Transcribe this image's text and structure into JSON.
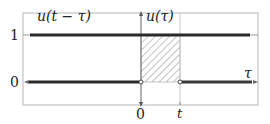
{
  "diagram": {
    "labels": {
      "shifted_step": "u(t − τ)",
      "step": "u(τ)",
      "y_one": "1",
      "y_zero": "0",
      "x_zero": "0",
      "x_t": "t",
      "x_axis": "τ"
    },
    "colors": {
      "frame": "#b0b0b0",
      "line": "#2a2a2a",
      "hatch": "#888888",
      "axis": "#555555",
      "background": "#ffffff"
    },
    "geometry": {
      "frame": {
        "x": 23,
        "y": 13,
        "w": 235,
        "h": 92
      },
      "axis_x": 141,
      "t_x": 180,
      "level_one_y": 35,
      "level_zero_y": 82
    }
  }
}
